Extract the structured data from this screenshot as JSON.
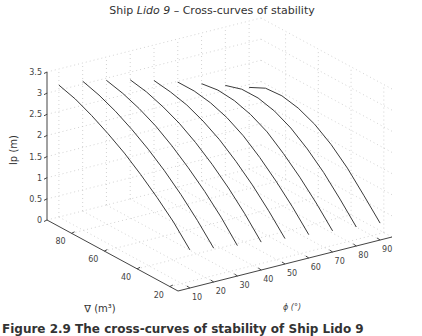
{
  "figure": {
    "title_parts": [
      "Ship ",
      "Lido 9",
      " – Cross-curves of stability"
    ],
    "caption": "Figure 2.9 The cross-curves of stability of Ship Lido 9"
  },
  "chart_data": {
    "type": "line3d",
    "title": "Ship Lido 9 – Cross-curves of stability",
    "xlabel": "ϕ (°)",
    "ylabel": "∇ (m³)",
    "zlabel": "lp (m)",
    "x_ticks": [
      10,
      20,
      30,
      40,
      50,
      60,
      70,
      80,
      90
    ],
    "y_ticks": [
      20,
      40,
      60,
      80
    ],
    "z_ticks": [
      0,
      0.5,
      1,
      1.5,
      2,
      2.5,
      3,
      3.5
    ],
    "xlim": [
      5,
      95
    ],
    "ylim": [
      15,
      95
    ],
    "zlim": [
      0,
      3.5
    ],
    "grid": true,
    "displacement": [
      15,
      25,
      35,
      45,
      55,
      65,
      75,
      85,
      95
    ],
    "series": [
      {
        "name": "ϕ = 10°",
        "phi": 10,
        "values": [
          0.9,
          1.35,
          1.72,
          2.05,
          2.35,
          2.6,
          2.82,
          3.0,
          3.12
        ]
      },
      {
        "name": "ϕ = 20°",
        "phi": 20,
        "values": [
          0.8,
          1.25,
          1.65,
          2.0,
          2.3,
          2.56,
          2.78,
          2.95,
          3.07
        ]
      },
      {
        "name": "ϕ = 30°",
        "phi": 30,
        "values": [
          0.72,
          1.18,
          1.58,
          1.93,
          2.24,
          2.5,
          2.7,
          2.85,
          2.95
        ]
      },
      {
        "name": "ϕ = 40°",
        "phi": 40,
        "values": [
          0.66,
          1.12,
          1.52,
          1.87,
          2.17,
          2.42,
          2.6,
          2.74,
          2.82
        ]
      },
      {
        "name": "ϕ = 50°",
        "phi": 50,
        "values": [
          0.6,
          1.05,
          1.45,
          1.8,
          2.1,
          2.33,
          2.5,
          2.6,
          2.66
        ]
      },
      {
        "name": "ϕ = 60°",
        "phi": 60,
        "values": [
          0.55,
          1.0,
          1.4,
          1.75,
          2.05,
          2.27,
          2.41,
          2.48,
          2.48
        ]
      },
      {
        "name": "ϕ = 70°",
        "phi": 70,
        "values": [
          0.5,
          0.95,
          1.35,
          1.7,
          2.0,
          2.2,
          2.32,
          2.36,
          2.3
        ]
      },
      {
        "name": "ϕ = 80°",
        "phi": 80,
        "values": [
          0.45,
          0.9,
          1.32,
          1.67,
          1.95,
          2.14,
          2.24,
          2.24,
          2.12
        ]
      },
      {
        "name": "ϕ = 90°",
        "phi": 90,
        "values": [
          0.4,
          0.85,
          1.28,
          1.63,
          1.9,
          2.07,
          2.15,
          2.12,
          1.93
        ]
      }
    ]
  }
}
